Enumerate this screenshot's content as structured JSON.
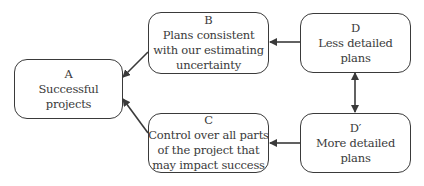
{
  "diagram": {
    "nodes": [
      {
        "id": "A",
        "label": "A",
        "lines": [
          "Successful",
          "projects"
        ]
      },
      {
        "id": "B",
        "label": "B",
        "lines": [
          "Plans consistent",
          "with our estimating",
          "uncertainty"
        ]
      },
      {
        "id": "C",
        "label": "C",
        "lines": [
          "Control over all parts",
          "of the project that",
          "may impact success"
        ]
      },
      {
        "id": "D",
        "label": "D",
        "lines": [
          "Less detailed",
          "plans"
        ]
      },
      {
        "id": "D'",
        "label": "D′",
        "lines": [
          "More detailed",
          "plans"
        ]
      }
    ],
    "edges": [
      {
        "from": "B",
        "to": "A",
        "directed": true
      },
      {
        "from": "C",
        "to": "A",
        "directed": true
      },
      {
        "from": "D",
        "to": "B",
        "directed": true
      },
      {
        "from": "D'",
        "to": "C",
        "directed": true
      },
      {
        "from": "D",
        "to": "D'",
        "directed": "both"
      }
    ],
    "colors": {
      "stroke": "#3a3a3a",
      "background": "#ffffff"
    }
  }
}
